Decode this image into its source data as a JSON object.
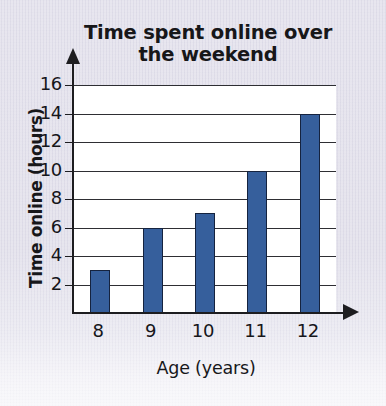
{
  "chart_data": {
    "type": "bar",
    "title": "Time spent online over\nthe weekend",
    "xlabel": "Age (years)",
    "ylabel": "Time online (hours)",
    "categories": [
      "8",
      "9",
      "10",
      "11",
      "12"
    ],
    "values": [
      3,
      6,
      7,
      10,
      14
    ],
    "ylim": [
      0,
      16
    ],
    "ytick_labels": [
      "2",
      "4",
      "6",
      "8",
      "10",
      "12",
      "14",
      "16"
    ],
    "ytick_values": [
      2,
      4,
      6,
      8,
      10,
      12,
      14,
      16
    ],
    "grid": "horizontal",
    "legend": "none",
    "series": [
      {
        "name": "Time online (hours)",
        "values": [
          3,
          6,
          7,
          10,
          14
        ]
      }
    ],
    "bar_color": "#365f9c",
    "bar_edge_color": "#15233f",
    "plot_background": "#ffffff",
    "page_background": "#dedce8",
    "axis_color": "#1d1d20",
    "gridline_color": "#2e2e33",
    "y_axis_arrow": "arrow-up",
    "x_axis_arrow": "arrow-right"
  }
}
